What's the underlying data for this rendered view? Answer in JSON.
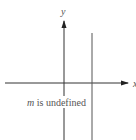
{
  "diagram": {
    "type": "coordinate-plane",
    "axes": {
      "x_label": "x",
      "y_label": "y",
      "color": "#333333"
    },
    "line": {
      "kind": "vertical",
      "color": "#555555"
    },
    "caption": {
      "italic_part": "m",
      "rest": " is undefined",
      "color": "#666666"
    }
  }
}
